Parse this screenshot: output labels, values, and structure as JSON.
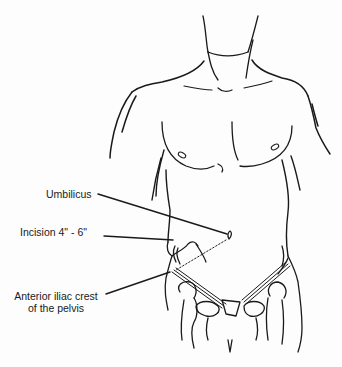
{
  "figure": {
    "stroke_color": "#1a1a1a",
    "background_color": "#fdfdfd"
  },
  "labels": {
    "umbilicus": "Umbilicus",
    "incision": "Incision 4\" - 6\"",
    "iliac_line1": "Anterior iliac crest",
    "iliac_line2": "of the pelvis"
  }
}
